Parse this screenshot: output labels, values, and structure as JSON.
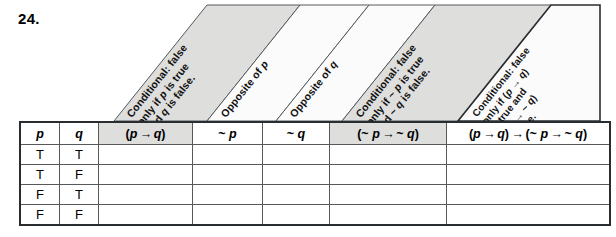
{
  "problem": {
    "number": "24."
  },
  "slanted_headers": [
    {
      "id": "header-conditional-p-q",
      "lines": [
        "Conditional: false",
        "only if p is true",
        "and q is false."
      ],
      "shaded": true
    },
    {
      "id": "header-opposite-of-p",
      "lines": [
        "Opposite of p"
      ],
      "shaded": false
    },
    {
      "id": "header-opposite-of-q",
      "lines": [
        "Opposite of q"
      ],
      "shaded": false
    },
    {
      "id": "header-conditional-notp-notq",
      "lines": [
        "Conditional: false",
        "only if ~ p is true",
        "and ~ q is false."
      ],
      "shaded": true
    },
    {
      "id": "header-conditional-biconditional",
      "lines": [
        "Conditional: false",
        "only if (p → q)",
        "is true and",
        "(~ p → ~ q)",
        "is false."
      ],
      "shaded": false
    }
  ],
  "table": {
    "columns": [
      {
        "key": "p",
        "label": "p",
        "shaded": false
      },
      {
        "key": "q",
        "label": "q",
        "shaded": false
      },
      {
        "key": "pq",
        "label": "(p → q)",
        "shaded": true
      },
      {
        "key": "np",
        "label": "~ p",
        "shaded": false
      },
      {
        "key": "nq",
        "label": "~ q",
        "shaded": false
      },
      {
        "key": "npnq",
        "label": "(~ p → ~ q)",
        "shaded": true
      },
      {
        "key": "full",
        "label": "(p → q) → (~ p → ~ q)",
        "shaded": false
      }
    ],
    "rows": [
      {
        "p": "T",
        "q": "T",
        "pq": "",
        "np": "",
        "nq": "",
        "npnq": "",
        "full": ""
      },
      {
        "p": "T",
        "q": "F",
        "pq": "",
        "np": "",
        "nq": "",
        "npnq": "",
        "full": ""
      },
      {
        "p": "F",
        "q": "T",
        "pq": "",
        "np": "",
        "nq": "",
        "npnq": "",
        "full": ""
      },
      {
        "p": "F",
        "q": "F",
        "pq": "",
        "np": "",
        "nq": "",
        "npnq": "",
        "full": ""
      }
    ]
  },
  "colors": {
    "shade": "#dededd",
    "border": "#55595c",
    "outer_border": "#2a2d2f",
    "text": "#111111",
    "background": "#ffffff"
  }
}
